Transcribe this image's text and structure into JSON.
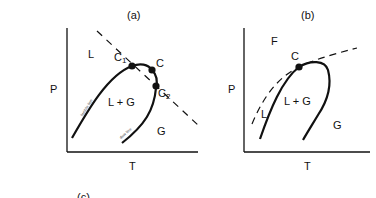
{
  "panels": [
    {
      "id": "a",
      "title": "(a)",
      "y_axis_label": "P",
      "x_axis_label": "T",
      "regions": {
        "liquid": "L",
        "two_phase": "L + G",
        "gas": "G"
      },
      "points": {
        "c1": "C",
        "c1_sub": "1",
        "c": "C",
        "c2": "C",
        "c2_sub": "2"
      },
      "curve_labels": {
        "bubble": "bubble line",
        "dew": "dew line"
      }
    },
    {
      "id": "b",
      "title": "(b)",
      "y_axis_label": "P",
      "x_axis_label": "T",
      "regions": {
        "fluid": "F",
        "liquid": "L",
        "two_phase": "L + G",
        "gas": "G"
      },
      "points": {
        "c": "C"
      }
    }
  ],
  "footer": {
    "partial_label": "(c)"
  },
  "colors": {
    "line": "#111111",
    "background": "#ffffff"
  }
}
